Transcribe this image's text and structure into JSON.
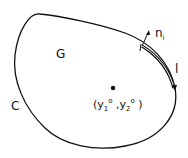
{
  "diagram": {
    "region_label": "G",
    "curve_label": "C",
    "normal_label_base": "n",
    "normal_label_sub": "i",
    "segment_label": "l",
    "point": {
      "open": "(",
      "y1_base": "y",
      "y1_sub": "1",
      "y1_sup": "o",
      "sep": ",",
      "y2_base": "y",
      "y2_sub": "2",
      "y2_sup": "o",
      "close": ")"
    }
  }
}
